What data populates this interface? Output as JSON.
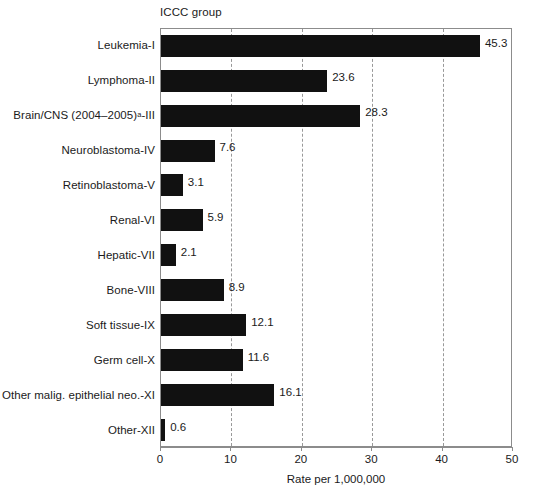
{
  "chart_data": {
    "type": "bar",
    "orientation": "horizontal",
    "title": "ICCC group",
    "xlabel": "Rate per 1,000,000",
    "ylabel": "",
    "xlim": [
      0,
      50
    ],
    "xticks": [
      0,
      10,
      20,
      30,
      40,
      50
    ],
    "xtick_labels": [
      "0",
      "10",
      "20",
      "30",
      "40",
      "50"
    ],
    "gridlines": [
      10,
      20,
      30,
      40
    ],
    "grid": true,
    "grid_style": "dashed-vertical",
    "legend": null,
    "bar_color": "#111111",
    "categories": [
      "Leukemia-I",
      "Lymphoma-II",
      "Brain/CNS (2004–2005)a-III",
      "Neuroblastoma-IV",
      "Retinoblastoma-V",
      "Renal-VI",
      "Hepatic-VII",
      "Bone-VIII",
      "Soft tissue-IX",
      "Germ cell-X",
      "Other malig. epithelial neo.-XI",
      "Other-XII"
    ],
    "values": [
      45.3,
      23.6,
      28.3,
      7.6,
      3.1,
      5.9,
      2.1,
      8.9,
      12.1,
      11.6,
      16.1,
      0.6
    ],
    "value_labels": [
      "45.3",
      "23.6",
      "28.3",
      "7.6",
      "3.1",
      "5.9",
      "2.1",
      "8.9",
      "12.1",
      "11.6",
      "16.1",
      "0.6"
    ],
    "rows": [
      {
        "label_html": "Leukemia-I",
        "label": "Leukemia-I",
        "value": 45.3,
        "value_label": "45.3"
      },
      {
        "label_html": "Lymphoma-II",
        "label": "Lymphoma-II",
        "value": 23.6,
        "value_label": "23.6"
      },
      {
        "label_html": "Brain/CNS (2004–2005)<sup>a</sup>-III",
        "label": "Brain/CNS (2004–2005)a-III",
        "value": 28.3,
        "value_label": "28.3"
      },
      {
        "label_html": "Neuroblastoma-IV",
        "label": "Neuroblastoma-IV",
        "value": 7.6,
        "value_label": "7.6"
      },
      {
        "label_html": "Retinoblastoma-V",
        "label": "Retinoblastoma-V",
        "value": 3.1,
        "value_label": "3.1"
      },
      {
        "label_html": "Renal-VI",
        "label": "Renal-VI",
        "value": 5.9,
        "value_label": "5.9"
      },
      {
        "label_html": "Hepatic-VII",
        "label": "Hepatic-VII",
        "value": 2.1,
        "value_label": "2.1"
      },
      {
        "label_html": "Bone-VIII",
        "label": "Bone-VIII",
        "value": 8.9,
        "value_label": "8.9"
      },
      {
        "label_html": "Soft tissue-IX",
        "label": "Soft tissue-IX",
        "value": 12.1,
        "value_label": "12.1"
      },
      {
        "label_html": "Germ cell-X",
        "label": "Germ cell-X",
        "value": 11.6,
        "value_label": "11.6"
      },
      {
        "label_html": "Other malig. epithelial neo.-XI",
        "label": "Other malig. epithelial neo.-XI",
        "value": 16.1,
        "value_label": "16.1"
      },
      {
        "label_html": "Other-XII",
        "label": "Other-XII",
        "value": 0.6,
        "value_label": "0.6"
      }
    ]
  }
}
